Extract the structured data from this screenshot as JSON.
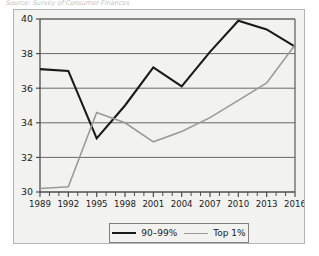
{
  "caption": "Source: Survey of Consumer Finances",
  "colors": {
    "series_dark": "#1a1a1a",
    "series_gray": "#9a9a9a",
    "axis": "#4d4d4d",
    "gridline": "#595959",
    "frame": "#b4b4b4",
    "panel_bg": "#f2f2f0",
    "legend_border": "#808080",
    "text": "#1a1a1a"
  },
  "legend": {
    "position": "bottom-center",
    "entries": [
      {
        "label": "90–99%",
        "color": "#1a1a1a",
        "width": 2.1
      },
      {
        "label": "Top 1%",
        "color": "#9a9a9a",
        "width": 1.6
      }
    ]
  },
  "chart_data": {
    "type": "line",
    "title": "",
    "subtitle": "",
    "xlabel": "",
    "ylabel": "",
    "xlim": [
      1989,
      2016
    ],
    "ylim": [
      30,
      40
    ],
    "ytick_values": [
      30,
      32,
      34,
      36,
      38,
      40
    ],
    "ytick_labels": [
      "30",
      "32",
      "34",
      "36",
      "38",
      "40"
    ],
    "xtick_values": [
      1989,
      1992,
      1995,
      1998,
      2001,
      2004,
      2007,
      2010,
      2013,
      2016
    ],
    "xtick_labels": [
      "1989",
      "1992",
      "1995",
      "1998",
      "2001",
      "2004",
      "2007",
      "2010",
      "2013",
      "2016"
    ],
    "x_minor_ticks": [
      1990,
      1991,
      1993,
      1994,
      1996,
      1997,
      1999,
      2000,
      2002,
      2003,
      2005,
      2006,
      2008,
      2009,
      2011,
      2012,
      2014,
      2015
    ],
    "grid": {
      "horizontal": true,
      "vertical": false
    },
    "x": [
      1989,
      1992,
      1995,
      1998,
      2001,
      2004,
      2007,
      2010,
      2013,
      2016
    ],
    "series": [
      {
        "name": "90–99%",
        "color": "#1a1a1a",
        "width": 2.1,
        "values": [
          37.1,
          37.0,
          33.1,
          35.0,
          37.2,
          36.1,
          38.1,
          39.9,
          39.4,
          38.4
        ]
      },
      {
        "name": "Top 1%",
        "color": "#9a9a9a",
        "width": 1.6,
        "values": [
          30.2,
          30.3,
          34.6,
          34.0,
          32.9,
          33.5,
          34.3,
          35.3,
          36.3,
          38.5
        ]
      }
    ],
    "annotations": []
  }
}
